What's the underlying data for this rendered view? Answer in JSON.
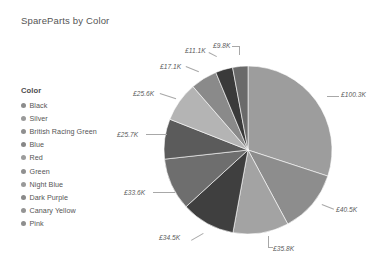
{
  "chart": {
    "title": "SpareParts by Color"
  },
  "legend": {
    "title": "Color",
    "items": [
      {
        "label": "Black",
        "color": "#8c8c8c"
      },
      {
        "label": "Silver",
        "color": "#9a9a9a"
      },
      {
        "label": "British Racing Green",
        "color": "#8f8f8f"
      },
      {
        "label": "Blue",
        "color": "#878787"
      },
      {
        "label": "Red",
        "color": "#9c9c9c"
      },
      {
        "label": "Green",
        "color": "#909090"
      },
      {
        "label": "Night Blue",
        "color": "#999999"
      },
      {
        "label": "Dark Purple",
        "color": "#8a8a8a"
      },
      {
        "label": "Canary Yellow",
        "color": "#949494"
      },
      {
        "label": "Pink",
        "color": "#8e8e8e"
      }
    ]
  },
  "labels": {
    "v_100_3k": "£100.3K",
    "v_40_5k": "£40.5K",
    "v_35_8k": "£35.8K",
    "v_34_5k": "£34.5K",
    "v_33_6k": "£33.6K",
    "v_25_7k": "£25.7K",
    "v_25_6k": "£25.6K",
    "v_17_1k": "£17.1K",
    "v_11_1k": "£11.1K",
    "v_9_8k": "£9.8K"
  },
  "chart_data": {
    "type": "pie",
    "title": "SpareParts by Color",
    "xlabel": "",
    "ylabel": "",
    "legend_title": "Color",
    "legend_position": "left",
    "grid": false,
    "value_prefix": "£",
    "value_suffix": "K",
    "total": 333.4,
    "start_angle_deg": 0,
    "direction": "clockwise",
    "categories": [
      "Black",
      "Silver",
      "British Racing Green",
      "Blue",
      "Red",
      "Green",
      "Night Blue",
      "Dark Purple",
      "Canary Yellow",
      "Pink"
    ],
    "values": [
      100.3,
      40.5,
      35.8,
      34.5,
      33.6,
      25.7,
      25.6,
      17.1,
      11.1,
      9.8
    ],
    "value_labels": [
      "£100.3K",
      "£40.5K",
      "£35.8K",
      "£34.5K",
      "£33.6K",
      "£25.7K",
      "£25.6K",
      "£17.1K",
      "£11.1K",
      "£9.8K"
    ],
    "percentages": [
      30.1,
      12.1,
      10.7,
      10.3,
      10.1,
      7.7,
      7.7,
      5.1,
      3.3,
      2.9
    ],
    "slice_colors": [
      "#9d9d9d",
      "#8d8d8d",
      "#a3a3a3",
      "#3f3f3f",
      "#6e6e6e",
      "#5b5b5b",
      "#b4b4b4",
      "#8a8a8a",
      "#3a3a3a",
      "#6a6a6a"
    ]
  }
}
